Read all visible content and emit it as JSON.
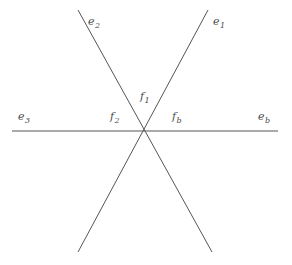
{
  "figure": {
    "background_color": "#ffffff",
    "line_color": "#555555",
    "label_color": "#4a4a4a",
    "line_width": 1,
    "width": 292,
    "height": 265,
    "intersection_point": {
      "x": 145,
      "y": 132
    }
  },
  "lines": [
    {
      "name": "line-e1",
      "description": "diagonal from lower-left to upper-right",
      "x1": 78,
      "y1": 252,
      "x2": 208,
      "y2": 10
    },
    {
      "name": "line-e2",
      "description": "diagonal from upper-left to lower-right",
      "x1": 78,
      "y1": 10,
      "x2": 212,
      "y2": 252
    },
    {
      "name": "line-e3-eb",
      "description": "horizontal line",
      "x1": 12,
      "y1": 131,
      "x2": 278,
      "y2": 131
    }
  ],
  "labels": [
    {
      "name": "label-e2",
      "base": "e",
      "sub": "2",
      "x": 88,
      "y": 16
    },
    {
      "name": "label-e1",
      "base": "e",
      "sub": "1",
      "x": 213,
      "y": 16
    },
    {
      "name": "label-f1",
      "base": "f",
      "sub": "1",
      "x": 140,
      "y": 91
    },
    {
      "name": "label-f2",
      "base": "f",
      "sub": "2",
      "x": 110,
      "y": 111
    },
    {
      "name": "label-fb",
      "base": "f",
      "sub": "b",
      "x": 172,
      "y": 111
    },
    {
      "name": "label-e3",
      "base": "e",
      "sub": "3",
      "x": 18,
      "y": 111
    },
    {
      "name": "label-eb",
      "base": "e",
      "sub": "b",
      "x": 258,
      "y": 111
    }
  ]
}
